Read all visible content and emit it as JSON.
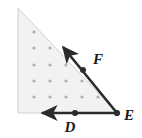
{
  "figure": {
    "canvas": {
      "width": 142,
      "height": 138,
      "background": "#ffffff"
    },
    "colors": {
      "region_fill": "#f2f2f2",
      "region_edge": "#cfcfcf",
      "dot": "#b0b0b0",
      "vector": "#2b2b2b",
      "label": "#1a1a1a"
    },
    "triangle": {
      "name": "shaded-right-triangle",
      "vertices": [
        {
          "name": "apex",
          "x": 18,
          "y": 8
        },
        {
          "name": "bottom-left",
          "x": 18,
          "y": 113
        },
        {
          "name": "bottom-right",
          "x": 117,
          "y": 113
        }
      ]
    },
    "dot_grid": {
      "name": "lattice-dots",
      "spacing": 16,
      "radius": 1.6,
      "rows": [
        {
          "y": 32,
          "xs": [
            34
          ]
        },
        {
          "y": 48,
          "xs": [
            34,
            50
          ]
        },
        {
          "y": 65,
          "xs": [
            34,
            50,
            66
          ]
        },
        {
          "y": 81,
          "xs": [
            34,
            50,
            66,
            82
          ]
        },
        {
          "y": 97,
          "xs": [
            34,
            50,
            66,
            82,
            98
          ]
        }
      ]
    },
    "vectors": [
      {
        "name": "vector-F",
        "from": {
          "x": 117,
          "y": 113
        },
        "to": {
          "x": 63,
          "y": 47
        },
        "point": {
          "x": 83,
          "y": 70
        },
        "label": "F",
        "label_x": 93,
        "label_y": 64,
        "direction": "up-left along hypotenuse"
      },
      {
        "name": "vector-D",
        "from": {
          "x": 117,
          "y": 113
        },
        "to": {
          "x": 42,
          "y": 113
        },
        "point": {
          "x": 75,
          "y": 113
        },
        "label": "D",
        "label_x": 70,
        "label_y": 132,
        "direction": "left along base"
      }
    ],
    "points": [
      {
        "name": "point-E",
        "label": "E",
        "x": 117,
        "y": 113,
        "label_x": 124,
        "label_y": 120
      },
      {
        "name": "point-F",
        "label": "F",
        "x": 83,
        "y": 70,
        "label_x": 93,
        "label_y": 64
      },
      {
        "name": "point-D",
        "label": "D",
        "x": 75,
        "y": 113,
        "label_x": 70,
        "label_y": 132
      }
    ]
  }
}
